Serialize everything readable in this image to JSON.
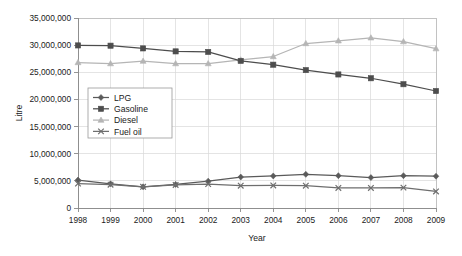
{
  "chart_data": {
    "type": "line",
    "title": "",
    "xlabel": "Year",
    "ylabel": "Litre",
    "categories": [
      1998,
      1999,
      2000,
      2001,
      2002,
      2003,
      2004,
      2005,
      2006,
      2007,
      2008,
      2009
    ],
    "xtick_labels": [
      "1998",
      "1999",
      "2000",
      "2001",
      "2002",
      "2003",
      "2004",
      "2005",
      "2006",
      "2007",
      "2008",
      "2009"
    ],
    "ytick_labels": [
      "0",
      "5,000,000",
      "10,000,000",
      "15,000,000",
      "20,000,000",
      "25,000,000",
      "30,000,000",
      "35,000,000"
    ],
    "ytick_values": [
      0,
      5000000,
      10000000,
      15000000,
      20000000,
      25000000,
      30000000,
      35000000
    ],
    "ylim": [
      0,
      35000000
    ],
    "grid": true,
    "legend_position": "inside-left-middle",
    "series": [
      {
        "name": "LPG",
        "color": "#5a5a5a",
        "marker": "diamond",
        "values": [
          5150000,
          4450000,
          3900000,
          4350000,
          4950000,
          5700000,
          5900000,
          6200000,
          5950000,
          5600000,
          5950000,
          5850000
        ]
      },
      {
        "name": "Gasoline",
        "color": "#4d4d4d",
        "marker": "square",
        "values": [
          29950000,
          29900000,
          29400000,
          28850000,
          28750000,
          27100000,
          26400000,
          25400000,
          24600000,
          23900000,
          22800000,
          21550000
        ]
      },
      {
        "name": "Diesel",
        "color": "#b5b5b5",
        "marker": "triangle",
        "values": [
          26800000,
          26600000,
          27050000,
          26600000,
          26600000,
          27300000,
          27900000,
          30300000,
          30800000,
          31350000,
          30650000,
          29350000
        ]
      },
      {
        "name": "Fuel oil",
        "color": "#6e6e6e",
        "marker": "cross",
        "values": [
          4500000,
          4300000,
          3900000,
          4250000,
          4400000,
          4100000,
          4150000,
          4100000,
          3700000,
          3700000,
          3750000,
          3050000
        ]
      }
    ]
  },
  "legend": {
    "items": [
      "LPG",
      "Gasoline",
      "Diesel",
      "Fuel oil"
    ]
  },
  "axes": {
    "x_title": "Year",
    "y_title": "Litre"
  }
}
